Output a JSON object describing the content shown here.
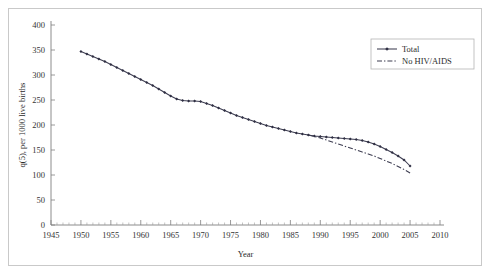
{
  "chart_data": {
    "type": "line",
    "title": "",
    "xlabel": "Year",
    "ylabel": "q(5), per 1000 live births",
    "xlim": [
      1945,
      2010
    ],
    "ylim": [
      0,
      400
    ],
    "xticks": [
      1945,
      1950,
      1955,
      1960,
      1965,
      1970,
      1975,
      1980,
      1985,
      1990,
      1995,
      2000,
      2005,
      2010
    ],
    "yticks": [
      0,
      50,
      100,
      150,
      200,
      250,
      300,
      350,
      400
    ],
    "xtick_labels": [
      "1945",
      "1950",
      "1955",
      "1960",
      "1965",
      "1970",
      "1975",
      "1980",
      "1985",
      "1990",
      "1995",
      "2000",
      "2005",
      "2010"
    ],
    "ytick_labels": [
      "0",
      "50",
      "100",
      "150",
      "200",
      "250",
      "300",
      "350",
      "400"
    ],
    "minor_xtick_interval": 1,
    "grid": false,
    "legend_position": "top-right",
    "series": [
      {
        "name": "Total",
        "style": "solid-with-markers",
        "marker": "diamond",
        "color": "#3c3c50",
        "x": [
          1950,
          1951,
          1952,
          1953,
          1954,
          1955,
          1956,
          1957,
          1958,
          1959,
          1960,
          1961,
          1962,
          1963,
          1964,
          1965,
          1966,
          1967,
          1968,
          1969,
          1970,
          1971,
          1972,
          1973,
          1974,
          1975,
          1976,
          1977,
          1978,
          1979,
          1980,
          1981,
          1982,
          1983,
          1984,
          1985,
          1986,
          1987,
          1988,
          1989,
          1990,
          1991,
          1992,
          1993,
          1994,
          1995,
          1996,
          1997,
          1998,
          1999,
          2000,
          2001,
          2002,
          2003,
          2004,
          2005
        ],
        "values": [
          347,
          342,
          337,
          332,
          327,
          321,
          315,
          309,
          303,
          297,
          291,
          285,
          279,
          272,
          265,
          258,
          252,
          249,
          248,
          248,
          247,
          243,
          239,
          234,
          229,
          224,
          219,
          215,
          211,
          207,
          203,
          199,
          196,
          193,
          190,
          187,
          184,
          182,
          180,
          178,
          177,
          176,
          175,
          174,
          173,
          172,
          171,
          169,
          166,
          162,
          157,
          151,
          145,
          138,
          130,
          118
        ]
      },
      {
        "name": "No HIV/AIDS",
        "style": "dash-dot",
        "color": "#3c3c50",
        "x": [
          1988,
          1989,
          1990,
          1991,
          1992,
          1993,
          1994,
          1995,
          1996,
          1997,
          1998,
          1999,
          2000,
          2001,
          2002,
          2003,
          2004,
          2005
        ],
        "values": [
          180,
          177,
          174,
          170,
          166,
          162,
          158,
          154,
          150,
          146,
          142,
          138,
          133,
          128,
          123,
          117,
          111,
          104
        ]
      }
    ]
  },
  "legend": {
    "entries": [
      {
        "label": "Total"
      },
      {
        "label": "No HIV/AIDS"
      }
    ]
  }
}
